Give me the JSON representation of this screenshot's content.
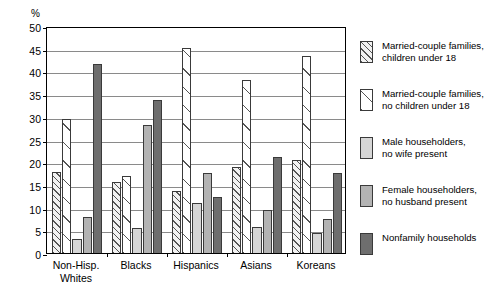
{
  "chart_data": {
    "type": "bar",
    "title": "",
    "subtitle": "",
    "xlabel": "",
    "ylabel": "%",
    "ylim": [
      0,
      50
    ],
    "ytick_step": 5,
    "yticks": [
      "50",
      "45",
      "40",
      "35",
      "30",
      "25",
      "20",
      "15",
      "10",
      "5",
      "0"
    ],
    "grid": true,
    "legend_position": "right",
    "categories": [
      "Non-Hisp.\nWhites",
      "Blacks",
      "Hispanics",
      "Asians",
      "Koreans"
    ],
    "series": [
      {
        "name": "Married-couple families,\nchildren under 18",
        "pattern": "pat-hatch-dense",
        "values": [
          17.8,
          15.7,
          13.7,
          18.9,
          20.4
        ]
      },
      {
        "name": "Married-couple families,\nno children under 18",
        "pattern": "pat-hatch-sparse",
        "values": [
          29.5,
          16.9,
          45.2,
          38.0,
          43.5
        ]
      },
      {
        "name": "Male householders,\nno wife present",
        "pattern": "pat-light",
        "values": [
          3.1,
          5.4,
          11.0,
          5.7,
          4.3
        ]
      },
      {
        "name": "Female householders,\nno husband present",
        "pattern": "pat-medium",
        "values": [
          7.9,
          28.2,
          17.7,
          9.4,
          7.4
        ]
      },
      {
        "name": "Nonfamily households",
        "pattern": "pat-dark",
        "values": [
          41.7,
          33.7,
          12.4,
          21.2,
          17.7
        ]
      }
    ],
    "hidden_bars": [
      {
        "group": 1,
        "series": 1,
        "value": 25.2
      },
      {
        "group": 4,
        "series": 1,
        "value": 26.2
      }
    ]
  },
  "legend": {
    "items": [
      {
        "label": "Married-couple families,\nchildren under 18"
      },
      {
        "label": "Married-couple families,\nno children under 18"
      },
      {
        "label": "Male householders,\nno wife present"
      },
      {
        "label": "Female householders,\nno husband present"
      },
      {
        "label": "Nonfamily households"
      }
    ]
  }
}
